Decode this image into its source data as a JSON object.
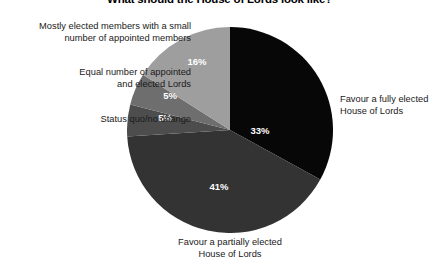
{
  "chart_data": {
    "type": "pie",
    "title": "What should the House of Lords look like?",
    "xlabel": "",
    "ylabel": "",
    "grid": false,
    "legend_position": "callout-labels",
    "start_angle_deg": 0,
    "direction": "clockwise",
    "categories": [
      "Favour a fully elected House of Lords",
      "Favour a partially elected House of Lords",
      "Status quo/no change",
      "Equal number of appointed and elected Lords",
      "Mostly elected members with a small number of appointed members"
    ],
    "values": [
      33,
      41,
      5,
      5,
      16
    ],
    "value_labels": [
      "33%",
      "41%",
      "5%",
      "5%",
      "16%"
    ],
    "colors": [
      "#070707",
      "#333333",
      "#4d4d4d",
      "#6e6e6e",
      "#9e9e9e"
    ],
    "slices": [
      {
        "label": "Favour a fully elected House of Lords",
        "value": 33,
        "display": "33%",
        "color": "#070707"
      },
      {
        "label": "Favour a partially elected House of Lords",
        "value": 41,
        "display": "41%",
        "color": "#333333"
      },
      {
        "label": "Status quo/no change",
        "value": 5,
        "display": "5%",
        "color": "#4d4d4d"
      },
      {
        "label": "Equal number of appointed and elected Lords",
        "value": 5,
        "display": "5%",
        "color": "#6e6e6e"
      },
      {
        "label": "Mostly elected members with a small number of appointed members",
        "value": 16,
        "display": "16%",
        "color": "#9e9e9e"
      }
    ]
  },
  "labels": {
    "mostly_elected": "Mostly elected members with a small\nnumber of appointed members",
    "equal_number": "Equal number of appointed\nand elected Lords",
    "status_quo": "Status quo/no change",
    "fully_elected": "Favour a fully elected\nHouse of Lords",
    "partially_elected": "Favour a partially elected\nHouse of Lords"
  },
  "values": {
    "fully_elected": "33%",
    "partially_elected": "41%",
    "status_quo": "5%",
    "equal_number": "5%",
    "mostly_elected": "16%"
  },
  "style": {
    "background": "#ffffff",
    "text_color": "#1a1a1a"
  }
}
